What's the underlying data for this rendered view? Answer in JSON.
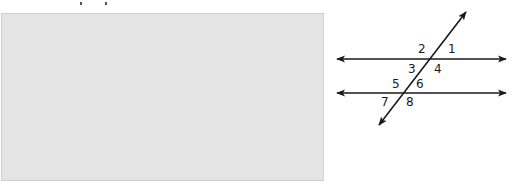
{
  "figure": {
    "type": "parallel lines cut by a transversal",
    "redacted_region": {
      "fill": "#e4e4e4",
      "border": "#cfcfcf"
    },
    "line_color": "#1a1a1a",
    "lines": [
      {
        "name": "top-parallel-line",
        "x1": 337,
        "y1": 59,
        "x2": 506,
        "y2": 59,
        "arrows": "both"
      },
      {
        "name": "bottom-parallel-line",
        "x1": 337,
        "y1": 93,
        "x2": 506,
        "y2": 93,
        "arrows": "both"
      },
      {
        "name": "transversal",
        "x1": 379,
        "y1": 125,
        "x2": 466,
        "y2": 12,
        "arrows": "both"
      }
    ],
    "angle_labels": [
      {
        "label": "1",
        "x": 448,
        "y": 53
      },
      {
        "label": "2",
        "x": 418,
        "y": 53
      },
      {
        "label": "3",
        "x": 408,
        "y": 73
      },
      {
        "label": "4",
        "x": 434,
        "y": 73
      },
      {
        "label": "5",
        "x": 392,
        "y": 88
      },
      {
        "label": "6",
        "x": 416,
        "y": 88
      },
      {
        "label": "7",
        "x": 381,
        "y": 106
      },
      {
        "label": "8",
        "x": 406,
        "y": 106
      }
    ]
  }
}
